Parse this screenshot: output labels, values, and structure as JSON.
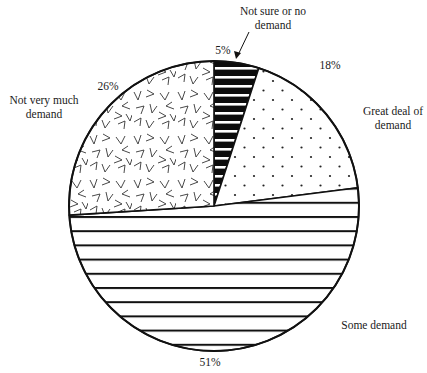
{
  "chart_data": {
    "type": "pie",
    "title": "",
    "start_angle_deg": 0,
    "direction": "clockwise",
    "slices": [
      {
        "label": "Not sure or no demand",
        "value": 5,
        "pct_label": "5%",
        "pattern": "black-with-white-stripes"
      },
      {
        "label": "Great deal of demand",
        "value": 18,
        "pct_label": "18%",
        "pattern": "dots"
      },
      {
        "label": "Some demand",
        "value": 51,
        "pct_label": "51%",
        "pattern": "horizontal-lines"
      },
      {
        "label": "Not very much demand",
        "value": 26,
        "pct_label": "26%",
        "pattern": "random-chevrons"
      }
    ],
    "legend": "none (direct labels)"
  },
  "labels": {
    "not_sure_l1": "Not sure or no",
    "not_sure_l2": "demand",
    "not_sure_pct": "5%",
    "great_l1": "Great deal of",
    "great_l2": "demand",
    "great_pct": "18%",
    "some_l1": "Some demand",
    "some_pct": "51%",
    "notvery_l1": "Not very much",
    "notvery_l2": "demand",
    "notvery_pct": "26%"
  },
  "colors": {
    "ink": "#111111",
    "background": "#ffffff"
  }
}
